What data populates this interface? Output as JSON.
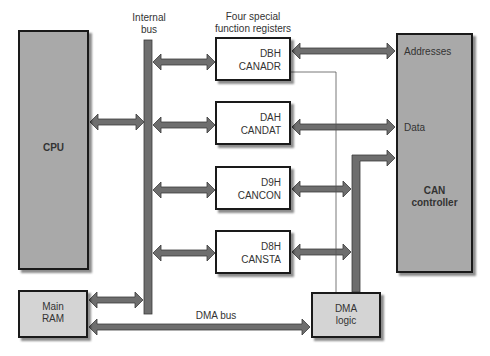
{
  "diagram": {
    "labels": {
      "internal_bus": [
        "Internal",
        "bus"
      ],
      "sfr_title": [
        "Four special",
        "function registers"
      ],
      "dma_bus": "DMA bus",
      "addresses": "Addresses",
      "data": "Data"
    },
    "blocks": {
      "cpu": "CPU",
      "main_ram": [
        "Main",
        "RAM"
      ],
      "dma_logic": [
        "DMA",
        "logic"
      ],
      "can_controller": [
        "CAN",
        "controller"
      ]
    },
    "registers": [
      {
        "code": "DBH",
        "name": "CANADR"
      },
      {
        "code": "DAH",
        "name": "CANDAT"
      },
      {
        "code": "D9H",
        "name": "CANCON"
      },
      {
        "code": "D8H",
        "name": "CANSTA"
      }
    ],
    "colors": {
      "arrow": "#6e6e6e",
      "dark_block": "#a9a9a9",
      "light_block": "#d4d4d4",
      "border": "#1a1a1a"
    }
  }
}
